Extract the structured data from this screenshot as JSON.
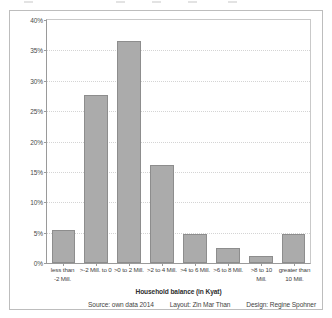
{
  "chart_data": {
    "type": "bar",
    "title": "",
    "xlabel": "Household balance (in Kyat)",
    "ylabel": "",
    "ylim": [
      0,
      40
    ],
    "grid": true,
    "legend": "none",
    "ytick_labels": [
      "0%",
      "5%",
      "10%",
      "15%",
      "20%",
      "25%",
      "30%",
      "35%",
      "40%"
    ],
    "ytick_values": [
      0,
      5,
      10,
      15,
      20,
      25,
      30,
      35,
      40
    ],
    "categories": [
      "less than\n-2 Mill.",
      ">-2 Mill. to 0",
      ">0 to 2 Mill.",
      ">2 to 4 Mill.",
      ">4 to 6 Mill.",
      ">6 to 8 Mill.",
      ">8 to 10 Mill.",
      "greater than\n10 Mill."
    ],
    "category_lines": [
      [
        "less than",
        "-2 Mill."
      ],
      [
        ">-2 Mill. to 0"
      ],
      [
        ">0 to 2 Mill."
      ],
      [
        ">2 to 4 Mill."
      ],
      [
        ">4 to 6 Mill."
      ],
      [
        ">6 to 8 Mill."
      ],
      [
        ">8 to 10 Mill."
      ],
      [
        "greater than",
        "10 Mill."
      ]
    ],
    "values": [
      5.4,
      27.7,
      36.6,
      16.1,
      4.8,
      2.4,
      1.2,
      4.8
    ],
    "bar_color": "#ababab",
    "bar_border_color": "#8d8d8d"
  },
  "credits": {
    "source": "Source: own data 2014",
    "layout": "Layout: Zin Mar Than",
    "design": "Design: Regine Spohner"
  }
}
